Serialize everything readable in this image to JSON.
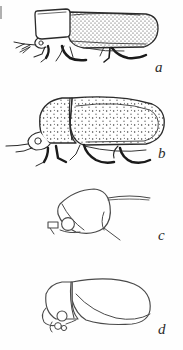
{
  "plate": {
    "title": "Beetle morphology plate",
    "background_color": "#fefefe",
    "ink_color": "#2b2b2b",
    "width": 183,
    "height": 350,
    "figure_count": 4
  },
  "figures": [
    {
      "label": "a",
      "caption_text": "a",
      "subject": "whole beetle, lateral view",
      "description": "elytra densely punctate, rectangular pronotum, legs extended",
      "texture": "dense fine punctation",
      "region": {
        "x": 18,
        "y": 4,
        "w": 140,
        "h": 62
      }
    },
    {
      "label": "b",
      "caption_text": "b",
      "subject": "whole beetle, lateral view",
      "description": "broad convex elytra with coarse scattered punctures, rounded head",
      "texture": "sparse coarse punctation",
      "region": {
        "x": 14,
        "y": 92,
        "w": 150,
        "h": 68
      }
    },
    {
      "label": "c",
      "caption_text": "c",
      "subject": "head and prothorax, lateral view",
      "description": "outline of head capsule with circular eye, antenna and maxillary palp",
      "texture": "plain outline",
      "region": {
        "x": 40,
        "y": 186,
        "w": 110,
        "h": 58
      }
    },
    {
      "label": "d",
      "caption_text": "d",
      "subject": "body, lateral view",
      "description": "outline of pronotum and elytron with eye and mouthparts",
      "texture": "plain outline",
      "region": {
        "x": 34,
        "y": 276,
        "w": 120,
        "h": 62
      }
    }
  ],
  "labels": {
    "a": "a",
    "b": "b",
    "c": "c",
    "d": "d"
  }
}
